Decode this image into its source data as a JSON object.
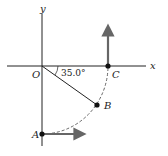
{
  "diagram": {
    "type": "kinematics-circular-path",
    "axes": {
      "x_label": "x",
      "y_label": "y",
      "origin_label": "O"
    },
    "points": [
      {
        "id": "A",
        "label": "A",
        "x": 42,
        "y": 134
      },
      {
        "id": "B",
        "label": "B",
        "x": 97,
        "y": 105
      },
      {
        "id": "C",
        "label": "C",
        "x": 108,
        "y": 66
      }
    ],
    "angle": {
      "label": "35.0°",
      "value_deg": 35.0,
      "between": "x-axis and OB"
    },
    "arrows": [
      {
        "at": "C",
        "direction": "up"
      },
      {
        "at": "A",
        "direction": "right"
      }
    ],
    "path": {
      "style": "dashed",
      "from": "A",
      "through": "B",
      "to": "C"
    },
    "colors": {
      "line": "#222222",
      "arrow": "#666666",
      "dashed": "#555555"
    }
  }
}
